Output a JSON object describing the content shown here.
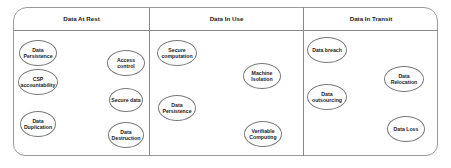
{
  "diagram": {
    "columns": [
      {
        "title": "Data At Rest",
        "items": [
          {
            "label": "Data\nPersistence"
          },
          {
            "label": "CSP\naccountability"
          },
          {
            "label": "Data\nDuplication"
          },
          {
            "label": "Access control"
          },
          {
            "label": "Secure data"
          },
          {
            "label": "Data\nDestruction"
          }
        ]
      },
      {
        "title": "Data In Use",
        "items": [
          {
            "label": "Secure\ncomputation"
          },
          {
            "label": "Machine\nIsolation"
          },
          {
            "label": "Data\nPersistence"
          },
          {
            "label": "Verifiable\nComputing"
          }
        ]
      },
      {
        "title": "Data In Transit",
        "items": [
          {
            "label": "Data breach"
          },
          {
            "label": "Data Relocation"
          },
          {
            "label": "Data\noutsourcing"
          },
          {
            "label": "Data Loss"
          }
        ]
      }
    ],
    "colors": {
      "border": "#9a9a9a",
      "text": "#1a1a1a",
      "background": "#ffffff"
    }
  }
}
